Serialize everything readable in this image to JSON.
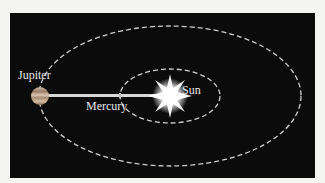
{
  "diagram": {
    "labels": {
      "jupiter": "Jupiter",
      "mercury": "Mercury",
      "sun": "Sun"
    },
    "colors": {
      "background": "#0b0b0b",
      "orbit": "#cfcfcf",
      "line": "#d8d8d8",
      "text": "#e8e8e8"
    }
  }
}
